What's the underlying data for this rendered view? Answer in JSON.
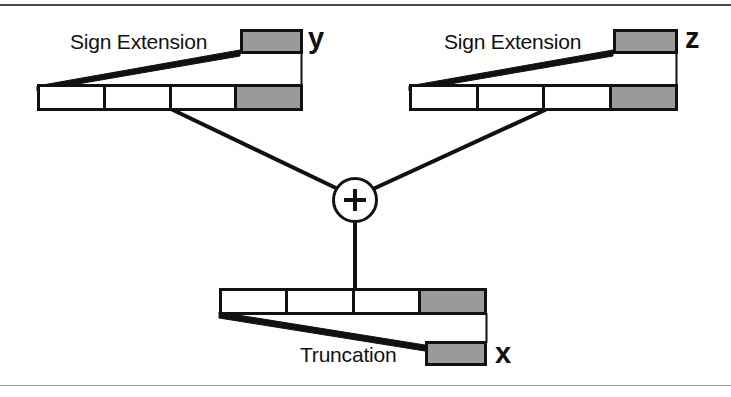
{
  "figure": {
    "width": 731,
    "height": 397,
    "background_color": "#ffffff",
    "line_color": "#111111",
    "shaded_color": "#9a9a9a",
    "top_rule_color": "#4a4a4a",
    "bottom_rule_color": "#9a9a9a"
  },
  "operands": {
    "y": {
      "var_label": "y",
      "caption": "Sign Extension",
      "word_cells": 4,
      "shaded_cell_index": 3,
      "word": {
        "x": 37,
        "y": 84,
        "width": 266,
        "height": 27
      },
      "extension_box": {
        "x": 240,
        "y": 29,
        "width": 63,
        "height": 25
      },
      "caption_pos": {
        "x": 70,
        "y": 31
      },
      "var_label_pos": {
        "x": 308,
        "y": 24
      }
    },
    "z": {
      "var_label": "z",
      "caption": "Sign Extension",
      "word_cells": 4,
      "shaded_cell_index": 3,
      "word": {
        "x": 409,
        "y": 84,
        "width": 269,
        "height": 27
      },
      "extension_box": {
        "x": 613,
        "y": 29,
        "width": 65,
        "height": 25
      },
      "caption_pos": {
        "x": 444,
        "y": 31
      },
      "var_label_pos": {
        "x": 685,
        "y": 24
      }
    },
    "x": {
      "var_label": "x",
      "caption": "Truncation",
      "word_cells": 4,
      "shaded_cell_index": 3,
      "word": {
        "x": 219,
        "y": 288,
        "width": 268,
        "height": 27
      },
      "truncation_box": {
        "x": 425,
        "y": 341,
        "width": 62,
        "height": 25
      },
      "caption_pos": {
        "x": 300,
        "y": 344
      },
      "var_label_pos": {
        "x": 495,
        "y": 339
      }
    }
  },
  "adder": {
    "symbol": "+",
    "name": "adder-node",
    "center": {
      "x": 355,
      "y": 200
    },
    "radius": 23
  },
  "wires": {
    "y_to_adder": {
      "from": {
        "x": 173,
        "y": 111
      },
      "to": {
        "x": 338,
        "y": 189
      }
    },
    "z_to_adder": {
      "from": {
        "x": 545,
        "y": 111
      },
      "to": {
        "x": 373,
        "y": 189
      }
    },
    "adder_to_x": {
      "from": {
        "x": 355,
        "y": 223
      },
      "to": {
        "x": 355,
        "y": 288
      }
    },
    "y_leader_top": {
      "from": {
        "x": 37,
        "y": 87
      },
      "to": {
        "x": 240,
        "y": 52
      }
    },
    "y_leader_bottom": {
      "from": {
        "x": 37,
        "y": 90
      },
      "to": {
        "x": 240,
        "y": 55
      }
    },
    "y_drop_right": {
      "from": {
        "x": 301,
        "y": 54
      },
      "to": {
        "x": 301,
        "y": 86
      }
    },
    "z_leader_top": {
      "from": {
        "x": 409,
        "y": 87
      },
      "to": {
        "x": 613,
        "y": 52
      }
    },
    "z_leader_bottom": {
      "from": {
        "x": 409,
        "y": 90
      },
      "to": {
        "x": 613,
        "y": 55
      }
    },
    "z_drop_right": {
      "from": {
        "x": 677,
        "y": 54
      },
      "to": {
        "x": 677,
        "y": 86
      }
    },
    "x_leader_top": {
      "from": {
        "x": 219,
        "y": 312
      },
      "to": {
        "x": 425,
        "y": 346
      }
    },
    "x_leader_bottom": {
      "from": {
        "x": 219,
        "y": 315
      },
      "to": {
        "x": 425,
        "y": 349
      }
    },
    "x_drop_right": {
      "from": {
        "x": 486,
        "y": 313
      },
      "to": {
        "x": 486,
        "y": 343
      }
    }
  }
}
